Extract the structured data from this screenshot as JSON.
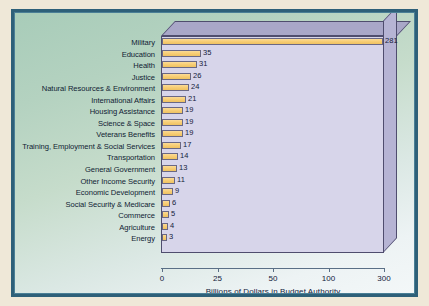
{
  "chart_data": {
    "type": "bar",
    "orientation": "horizontal",
    "title": "",
    "xlabel": "Billions of Dollars in Budget Authority",
    "ylabel": "",
    "grid": false,
    "legend": false,
    "axis_scale": "non-linear (evenly spaced ticks at 0, 25, 50, 100, 300)",
    "xticks": [
      "0",
      "25",
      "50",
      "100",
      "300"
    ],
    "xtick_values": [
      0,
      25,
      50,
      100,
      300
    ],
    "categories": [
      "Military",
      "Education",
      "Health",
      "Justice",
      "Natural Resources & Environment",
      "International Affairs",
      "Housing Assistance",
      "Science & Space",
      "Veterans Benefits",
      "Training, Employment & Social Services",
      "Transportation",
      "General Government",
      "Other Income Security",
      "Economic Development",
      "Social Security & Medicare",
      "Commerce",
      "Agriculture",
      "Energy"
    ],
    "values": [
      281,
      35,
      31,
      26,
      24,
      21,
      19,
      19,
      19,
      17,
      14,
      13,
      11,
      9,
      6,
      5,
      4,
      3
    ],
    "value_labels": [
      "281",
      "35",
      "31",
      "26",
      "24",
      "21",
      "19",
      "19",
      "19",
      "17",
      "14",
      "13",
      "11",
      "9",
      "6",
      "5",
      "4",
      "3"
    ],
    "bar_pixel_widths": [
      221,
      39,
      35,
      29,
      27,
      24,
      21,
      21,
      21,
      19,
      16,
      15,
      13,
      11,
      8,
      7,
      6,
      5
    ],
    "colors": {
      "bar_fill": "#f7cd74",
      "bar_edge": "#6a6884",
      "plot_background": "#d7d5ea",
      "plot_3d_top": "#a9a7c8",
      "plot_3d_side": "#b6b4d4",
      "canvas_background_top": "#a8ccb9",
      "canvas_background_bottom": "#f3f7f8",
      "frame_border": "#2e6079",
      "paper_margin": "#efe8d8",
      "text": "#12203a"
    }
  }
}
